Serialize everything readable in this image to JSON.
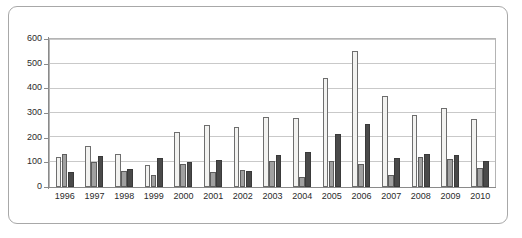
{
  "chart_data": {
    "type": "bar",
    "title": "",
    "subtitle": "",
    "xlabel": "",
    "ylabel": "",
    "ylim": [
      0,
      600
    ],
    "yticks": [
      0,
      100,
      200,
      300,
      400,
      500,
      600
    ],
    "ytick_labels": [
      "0",
      "100",
      "200",
      "300",
      "400",
      "500",
      "600"
    ],
    "grid": true,
    "legend": "none",
    "categories": [
      "1996",
      "1997",
      "1998",
      "1999",
      "2000",
      "2001",
      "2002",
      "2003",
      "2004",
      "2005",
      "2006",
      "2007",
      "2008",
      "2009",
      "2010"
    ],
    "series": [
      {
        "name": "series-1",
        "color": "#f2f2f0",
        "values": [
          120,
          165,
          133,
          88,
          222,
          250,
          242,
          282,
          280,
          440,
          553,
          370,
          292,
          322,
          275
        ]
      },
      {
        "name": "series-2",
        "color": "#a0a0a0",
        "values": [
          135,
          103,
          65,
          47,
          92,
          60,
          70,
          105,
          40,
          105,
          95,
          48,
          122,
          115,
          78
        ]
      },
      {
        "name": "series-3",
        "color": "#4a4a4a",
        "values": [
          62,
          125,
          72,
          118,
          100,
          110,
          65,
          128,
          140,
          215,
          255,
          118,
          133,
          130,
          105
        ]
      }
    ]
  },
  "caption": {
    "text": ""
  },
  "colors": {
    "series_1": "#f2f2f0",
    "series_2": "#a0a0a0",
    "series_3": "#4a4a4a",
    "gridline": "#c9c9c9",
    "axis": "#8a8a8a",
    "frame": "#a8a8a8"
  }
}
